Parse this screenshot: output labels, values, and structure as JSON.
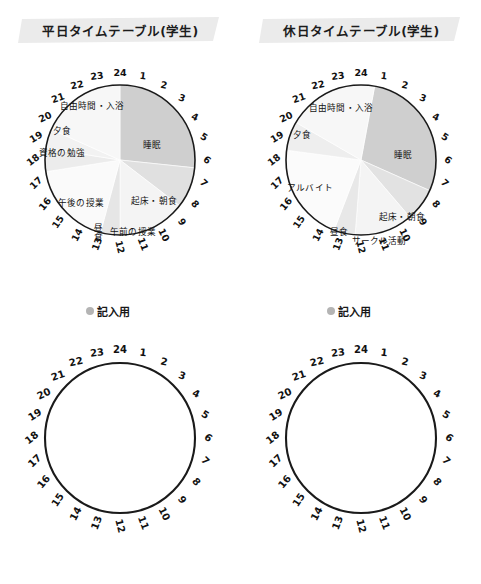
{
  "meta": {
    "colors": {
      "banner_gray": "#ebebeb",
      "sleep_gray": "#cfcfcf",
      "mid_gray": "#e4e4e4",
      "light_gray": "#f1f1f1",
      "pale_gray": "#f7f7f7",
      "outline": "#1a1a1a",
      "legend_dot": "#b4b4b4"
    },
    "hours": [
      1,
      2,
      3,
      4,
      5,
      6,
      7,
      8,
      9,
      10,
      11,
      12,
      13,
      14,
      15,
      16,
      17,
      18,
      19,
      20,
      21,
      22,
      23,
      24
    ]
  },
  "legend": {
    "label": "記入用",
    "dot_icon": "filled-circle-icon"
  },
  "charts": [
    {
      "id": "weekday",
      "title": "平日タイムテーブル(学生)",
      "chart_data": {
        "type": "pie",
        "title": "平日タイムテーブル(学生)",
        "note": "24-hour clock pie; angle 0 = 24:00 at top, clockwise",
        "xlabel": "",
        "ylabel": "",
        "segments": [
          {
            "label": "睡眠",
            "start_hour": 0.0,
            "end_hour": 6.4,
            "hours": 6.4,
            "fill": "#cfcfcf",
            "label_x": 132,
            "label_y": 85
          },
          {
            "label": "起床・朝食",
            "start_hour": 6.4,
            "end_hour": 8.5,
            "hours": 2.1,
            "fill": "#e0e0e0",
            "label_x": 134,
            "label_y": 141
          },
          {
            "label": "午前の授業",
            "start_hour": 8.5,
            "end_hour": 12.0,
            "hours": 3.5,
            "fill": "#f4f4f4",
            "label_x": 113,
            "label_y": 172
          },
          {
            "label": "昼食",
            "start_hour": 12.0,
            "end_hour": 13.0,
            "hours": 1.0,
            "fill": "#e6e6e6",
            "label_x": 77,
            "label_y": 172,
            "vertical": true
          },
          {
            "label": "午後の授業",
            "start_hour": 13.0,
            "end_hour": 17.4,
            "hours": 4.4,
            "fill": "#fafafa",
            "label_x": 61,
            "label_y": 143
          },
          {
            "label": "資格の勉強",
            "start_hour": 17.4,
            "end_hour": 18.6,
            "hours": 1.2,
            "fill": "#ececec",
            "label_x": 42,
            "label_y": 93
          },
          {
            "label": "夕食",
            "start_hour": 18.6,
            "end_hour": 19.6,
            "hours": 1.0,
            "fill": "#f2f2f2",
            "label_x": 42,
            "label_y": 71
          },
          {
            "label": "自由時間・入浴",
            "start_hour": 19.6,
            "end_hour": 24.0,
            "hours": 4.4,
            "fill": "#f7f7f7",
            "label_x": 72,
            "label_y": 46
          }
        ]
      }
    },
    {
      "id": "holiday",
      "title": "休日タイムテーブル(学生)",
      "chart_data": {
        "type": "pie",
        "title": "休日タイムテーブル(学生)",
        "note": "24-hour clock pie; angle 0 = 24:00 at top, clockwise",
        "xlabel": "",
        "ylabel": "",
        "segments": [
          {
            "label": "睡眠",
            "start_hour": 0.7,
            "end_hour": 7.6,
            "hours": 6.9,
            "fill": "#cfcfcf",
            "label_x": 142,
            "label_y": 95
          },
          {
            "label": "起床・朝食",
            "start_hour": 7.6,
            "end_hour": 9.3,
            "hours": 1.7,
            "fill": "#e2e2e2",
            "label_x": 141,
            "label_y": 157
          },
          {
            "label": "サークル活動",
            "start_hour": 9.3,
            "end_hour": 12.3,
            "hours": 3.0,
            "fill": "#f4f4f4",
            "label_x": 118,
            "label_y": 181
          },
          {
            "label": "昼食",
            "start_hour": 12.3,
            "end_hour": 13.4,
            "hours": 1.1,
            "fill": "#e8e8e8",
            "label_x": 78,
            "label_y": 172
          },
          {
            "label": "アルバイト",
            "start_hour": 13.4,
            "end_hour": 18.5,
            "hours": 5.1,
            "fill": "#fbfbfb",
            "label_x": 49,
            "label_y": 128
          },
          {
            "label": "夕食",
            "start_hour": 18.5,
            "end_hour": 20.0,
            "hours": 1.5,
            "fill": "#eeeeee",
            "label_x": 41,
            "label_y": 75
          },
          {
            "label": "自由時間・入浴",
            "start_hour": 20.0,
            "end_hour": 24.7,
            "hours": 4.7,
            "fill": "#f7f7f7",
            "label_x": 80,
            "label_y": 48
          }
        ]
      }
    }
  ]
}
